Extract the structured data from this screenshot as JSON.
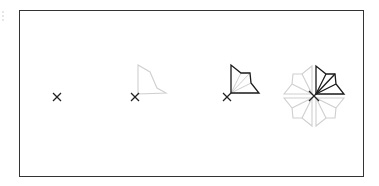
{
  "diagram": {
    "title": "",
    "stages": [
      {
        "id": "stage-1",
        "description": "origin marker only"
      },
      {
        "id": "stage-2",
        "description": "origin with faint kite outline"
      },
      {
        "id": "stage-3",
        "description": "origin with dark kite and internal triangulation"
      },
      {
        "id": "stage-4",
        "description": "kite reflected into 8 symmetric copies around origin"
      }
    ],
    "colors": {
      "frame": "#333333",
      "dark": "#1a1a1a",
      "faint": "#cccccc",
      "mid": "#bdbdbd"
    }
  }
}
